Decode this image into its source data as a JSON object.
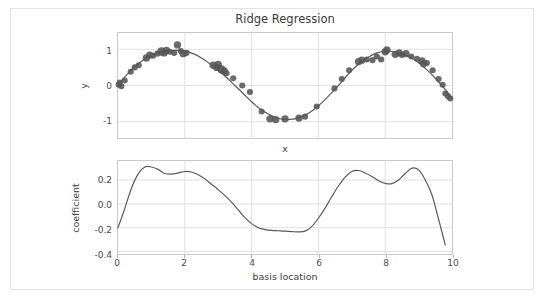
{
  "figure": {
    "title": "Ridge Regression",
    "background": "#ffffff",
    "frame_color": "#e3e3e3",
    "line_color": "#595959",
    "marker_color": "#555555",
    "grid_color": "#e0e0e0",
    "axis_color": "#c9c9c9"
  },
  "chart_data": [
    {
      "type": "scatter",
      "title": "Ridge Regression",
      "xlabel": "x",
      "ylabel": "y",
      "xlim": [
        0,
        10
      ],
      "ylim": [
        -1.45,
        1.45
      ],
      "grid": true,
      "legend": "none",
      "xticks": [
        0,
        2,
        4,
        6,
        8,
        10
      ],
      "xticklabels": [
        "",
        "",
        "",
        "",
        "",
        ""
      ],
      "yticks": [
        -1,
        0,
        1
      ],
      "yticklabels": [
        "-1",
        "0",
        "1"
      ],
      "series": [
        {
          "name": "fitted curve",
          "type": "line",
          "x": [
            0.0,
            0.25,
            0.5,
            0.75,
            1.0,
            1.25,
            1.5,
            1.75,
            2.0,
            2.25,
            2.5,
            2.75,
            3.0,
            3.25,
            3.5,
            3.75,
            4.0,
            4.25,
            4.5,
            4.75,
            5.0,
            5.25,
            5.5,
            5.75,
            6.0,
            6.25,
            6.5,
            6.75,
            7.0,
            7.25,
            7.5,
            7.75,
            8.0,
            8.25,
            8.5,
            8.75,
            9.0,
            9.25,
            9.5,
            9.75,
            10.0
          ],
          "y": [
            0.02,
            0.28,
            0.52,
            0.7,
            0.84,
            0.92,
            0.96,
            0.97,
            0.95,
            0.88,
            0.76,
            0.6,
            0.42,
            0.22,
            0.0,
            -0.22,
            -0.45,
            -0.64,
            -0.79,
            -0.89,
            -0.94,
            -0.93,
            -0.86,
            -0.74,
            -0.56,
            -0.34,
            -0.1,
            0.16,
            0.42,
            0.63,
            0.79,
            0.9,
            0.95,
            0.94,
            0.88,
            0.78,
            0.63,
            0.43,
            0.2,
            -0.06,
            -0.34
          ]
        },
        {
          "name": "observations",
          "type": "scatter",
          "points": [
            {
              "x": 0.02,
              "y": 0.02,
              "s": 5
            },
            {
              "x": 0.05,
              "y": 0.08,
              "s": 5
            },
            {
              "x": 0.1,
              "y": -0.02,
              "s": 5
            },
            {
              "x": 0.2,
              "y": 0.14,
              "s": 5
            },
            {
              "x": 0.38,
              "y": 0.38,
              "s": 5
            },
            {
              "x": 0.5,
              "y": 0.5,
              "s": 5
            },
            {
              "x": 0.62,
              "y": 0.56,
              "s": 5
            },
            {
              "x": 0.85,
              "y": 0.76,
              "s": 6
            },
            {
              "x": 0.95,
              "y": 0.84,
              "s": 6
            },
            {
              "x": 1.05,
              "y": 0.82,
              "s": 5
            },
            {
              "x": 1.18,
              "y": 0.88,
              "s": 5
            },
            {
              "x": 1.3,
              "y": 0.94,
              "s": 7
            },
            {
              "x": 1.38,
              "y": 0.9,
              "s": 6
            },
            {
              "x": 1.45,
              "y": 0.97,
              "s": 6
            },
            {
              "x": 1.55,
              "y": 0.93,
              "s": 5
            },
            {
              "x": 1.68,
              "y": 0.9,
              "s": 5
            },
            {
              "x": 1.78,
              "y": 1.12,
              "s": 6
            },
            {
              "x": 1.88,
              "y": 0.95,
              "s": 5
            },
            {
              "x": 1.95,
              "y": 0.88,
              "s": 6
            },
            {
              "x": 2.05,
              "y": 0.9,
              "s": 5
            },
            {
              "x": 2.85,
              "y": 0.56,
              "s": 6
            },
            {
              "x": 2.95,
              "y": 0.5,
              "s": 6
            },
            {
              "x": 3.0,
              "y": 0.58,
              "s": 6
            },
            {
              "x": 3.1,
              "y": 0.44,
              "s": 7
            },
            {
              "x": 3.18,
              "y": 0.4,
              "s": 6
            },
            {
              "x": 3.25,
              "y": 0.34,
              "s": 5
            },
            {
              "x": 3.45,
              "y": 0.2,
              "s": 5
            },
            {
              "x": 3.72,
              "y": 0.0,
              "s": 5
            },
            {
              "x": 3.95,
              "y": -0.18,
              "s": 5
            },
            {
              "x": 4.3,
              "y": -0.72,
              "s": 5
            },
            {
              "x": 4.55,
              "y": -0.92,
              "s": 6
            },
            {
              "x": 4.72,
              "y": -0.94,
              "s": 6
            },
            {
              "x": 5.0,
              "y": -0.92,
              "s": 6
            },
            {
              "x": 5.42,
              "y": -0.9,
              "s": 6
            },
            {
              "x": 5.6,
              "y": -0.86,
              "s": 5
            },
            {
              "x": 5.95,
              "y": -0.58,
              "s": 5
            },
            {
              "x": 6.48,
              "y": -0.08,
              "s": 5
            },
            {
              "x": 6.7,
              "y": 0.18,
              "s": 5
            },
            {
              "x": 6.92,
              "y": 0.42,
              "s": 5
            },
            {
              "x": 7.2,
              "y": 0.66,
              "s": 6
            },
            {
              "x": 7.3,
              "y": 0.7,
              "s": 6
            },
            {
              "x": 7.45,
              "y": 0.72,
              "s": 5
            },
            {
              "x": 7.62,
              "y": 0.7,
              "s": 5
            },
            {
              "x": 7.75,
              "y": 0.8,
              "s": 5
            },
            {
              "x": 7.88,
              "y": 0.72,
              "s": 5
            },
            {
              "x": 8.0,
              "y": 0.93,
              "s": 6
            },
            {
              "x": 8.05,
              "y": 0.98,
              "s": 6
            },
            {
              "x": 8.3,
              "y": 0.86,
              "s": 6
            },
            {
              "x": 8.42,
              "y": 0.9,
              "s": 6
            },
            {
              "x": 8.5,
              "y": 0.84,
              "s": 5
            },
            {
              "x": 8.62,
              "y": 0.88,
              "s": 6
            },
            {
              "x": 8.78,
              "y": 0.8,
              "s": 5
            },
            {
              "x": 8.95,
              "y": 0.74,
              "s": 5
            },
            {
              "x": 9.1,
              "y": 0.68,
              "s": 6
            },
            {
              "x": 9.15,
              "y": 0.6,
              "s": 6
            },
            {
              "x": 9.25,
              "y": 0.62,
              "s": 5
            },
            {
              "x": 9.42,
              "y": 0.42,
              "s": 5
            },
            {
              "x": 9.6,
              "y": 0.18,
              "s": 5
            },
            {
              "x": 9.72,
              "y": 0.02,
              "s": 5
            },
            {
              "x": 9.8,
              "y": -0.22,
              "s": 5
            },
            {
              "x": 9.88,
              "y": -0.3,
              "s": 5
            },
            {
              "x": 9.95,
              "y": -0.36,
              "s": 5
            }
          ]
        }
      ]
    },
    {
      "type": "line",
      "title": "",
      "xlabel": "basis location",
      "ylabel": "coefficient",
      "xlim": [
        0,
        10
      ],
      "ylim": [
        -0.42,
        0.36
      ],
      "grid": true,
      "legend": "none",
      "xticks": [
        0,
        2,
        4,
        6,
        8,
        10
      ],
      "xticklabels": [
        "0",
        "2",
        "4",
        "6",
        "8",
        "10"
      ],
      "yticks": [
        -0.4,
        -0.2,
        0.0,
        0.2
      ],
      "yticklabels": [
        "-0.4",
        "-0.2",
        "0.0",
        "0.2"
      ],
      "series": [
        {
          "name": "coefficients",
          "x": [
            0.0,
            0.2,
            0.4,
            0.6,
            0.8,
            1.0,
            1.2,
            1.4,
            1.6,
            1.8,
            2.0,
            2.2,
            2.4,
            2.6,
            2.8,
            3.0,
            3.2,
            3.4,
            3.6,
            3.8,
            4.0,
            4.2,
            4.4,
            4.6,
            4.8,
            5.0,
            5.2,
            5.4,
            5.6,
            5.8,
            6.0,
            6.2,
            6.4,
            6.6,
            6.8,
            7.0,
            7.2,
            7.4,
            7.6,
            7.8,
            8.0,
            8.2,
            8.4,
            8.6,
            8.8,
            9.0,
            9.2,
            9.4,
            9.6,
            9.8
          ],
          "y": [
            -0.2,
            -0.04,
            0.13,
            0.25,
            0.31,
            0.31,
            0.29,
            0.255,
            0.25,
            0.26,
            0.272,
            0.268,
            0.245,
            0.21,
            0.165,
            0.12,
            0.07,
            0.015,
            -0.05,
            -0.115,
            -0.165,
            -0.2,
            -0.215,
            -0.222,
            -0.225,
            -0.228,
            -0.232,
            -0.235,
            -0.228,
            -0.19,
            -0.12,
            -0.035,
            0.06,
            0.15,
            0.225,
            0.272,
            0.28,
            0.26,
            0.23,
            0.195,
            0.172,
            0.17,
            0.2,
            0.255,
            0.3,
            0.285,
            0.2,
            0.075,
            -0.13,
            -0.345
          ]
        }
      ]
    }
  ]
}
